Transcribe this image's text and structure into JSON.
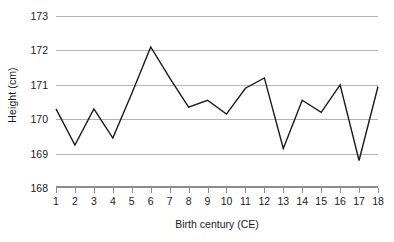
{
  "chart_data": {
    "type": "line",
    "title": "",
    "xlabel": "Birth century (CE)",
    "ylabel": "Height (cm)",
    "x": [
      1,
      2,
      3,
      4,
      5,
      6,
      7,
      8,
      9,
      10,
      11,
      12,
      13,
      14,
      15,
      16,
      17,
      18
    ],
    "xtick_labels": [
      "1",
      "2",
      "3",
      "4",
      "5",
      "6",
      "7",
      "8",
      "9",
      "10",
      "11",
      "12",
      "13",
      "14",
      "15",
      "16",
      "17",
      "18"
    ],
    "values": [
      170.3,
      169.25,
      170.3,
      169.45,
      170.75,
      172.1,
      171.2,
      170.35,
      170.55,
      170.15,
      170.9,
      171.2,
      169.15,
      170.55,
      170.2,
      171.0,
      168.8,
      170.95
    ],
    "ylim": [
      168,
      173
    ],
    "xlim": [
      1,
      18
    ],
    "ytick_labels": [
      "168",
      "169",
      "170",
      "171",
      "172",
      "173"
    ],
    "ytick_values": [
      168,
      169,
      170,
      171,
      172,
      173
    ],
    "grid": "horizontal",
    "legend": "none",
    "line_color": "#1a1a1a",
    "grid_color": "#b4b4b4",
    "axis_color": "#8c8c8c",
    "background": "#ffffff"
  }
}
